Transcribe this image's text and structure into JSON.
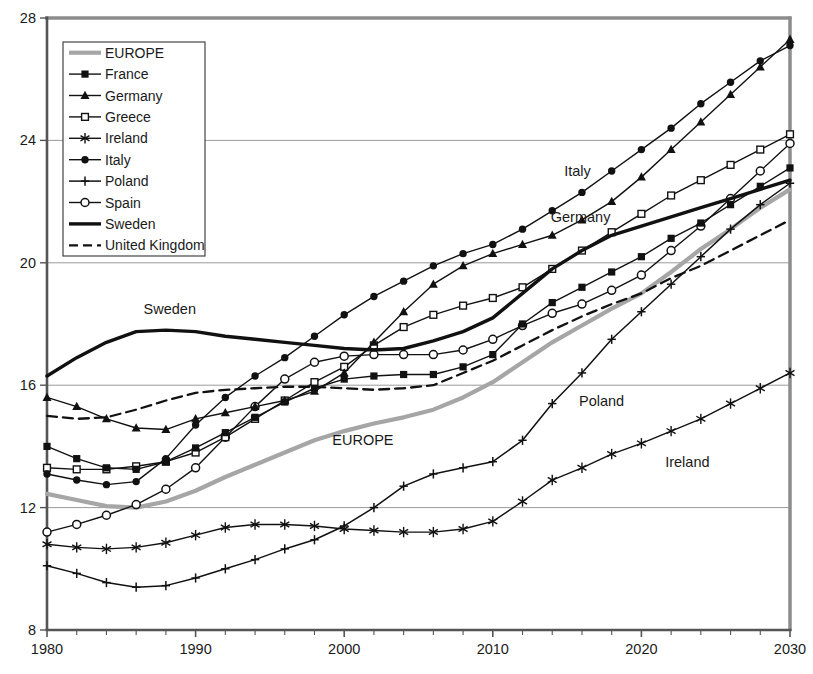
{
  "chart_data": {
    "type": "line",
    "title": "",
    "xlabel": "",
    "ylabel": "",
    "xlim": [
      1980,
      2030
    ],
    "ylim": [
      8,
      28
    ],
    "x_ticks": [
      1980,
      1990,
      2000,
      2010,
      2020,
      2030
    ],
    "x_minor_tick_step": 2,
    "y_ticks": [
      8,
      12,
      16,
      20,
      24,
      28
    ],
    "grid": "horizontal",
    "legend_position": "top-left-inside",
    "x": [
      1980,
      1982,
      1984,
      1986,
      1988,
      1990,
      1992,
      1994,
      1996,
      1998,
      2000,
      2002,
      2004,
      2006,
      2008,
      2010,
      2012,
      2014,
      2016,
      2018,
      2020,
      2022,
      2024,
      2026,
      2028,
      2030
    ],
    "series": [
      {
        "name": "EUROPE",
        "marker": "none",
        "color": "#a6a6a6",
        "width": 4.2,
        "dash": "",
        "values": [
          12.45,
          12.25,
          12.05,
          12.0,
          12.2,
          12.55,
          13.0,
          13.4,
          13.8,
          14.2,
          14.5,
          14.75,
          14.95,
          15.2,
          15.6,
          16.1,
          16.75,
          17.4,
          17.95,
          18.5,
          19.0,
          19.7,
          20.45,
          21.1,
          21.8,
          22.4
        ]
      },
      {
        "name": "France",
        "marker": "filled-square",
        "color": "#111111",
        "width": 1.4,
        "dash": "",
        "values": [
          14.0,
          13.6,
          13.3,
          13.25,
          13.5,
          13.95,
          14.45,
          14.95,
          15.45,
          15.9,
          16.2,
          16.3,
          16.35,
          16.35,
          16.6,
          17.0,
          18.0,
          18.7,
          19.2,
          19.7,
          20.2,
          20.8,
          21.3,
          21.9,
          22.5,
          23.1
        ]
      },
      {
        "name": "Germany",
        "marker": "filled-triangle",
        "color": "#111111",
        "width": 1.4,
        "dash": "",
        "values": [
          15.6,
          15.3,
          14.9,
          14.6,
          14.55,
          14.9,
          15.1,
          15.3,
          15.5,
          15.8,
          16.4,
          17.4,
          18.4,
          19.3,
          19.9,
          20.3,
          20.6,
          20.9,
          21.4,
          22.0,
          22.8,
          23.7,
          24.6,
          25.5,
          26.4,
          27.3
        ]
      },
      {
        "name": "Greece",
        "marker": "open-square",
        "color": "#111111",
        "width": 1.4,
        "dash": "",
        "values": [
          13.3,
          13.25,
          13.25,
          13.35,
          13.5,
          13.8,
          14.3,
          14.9,
          15.5,
          16.1,
          16.6,
          17.3,
          17.9,
          18.3,
          18.6,
          18.85,
          19.2,
          19.8,
          20.4,
          21.0,
          21.6,
          22.2,
          22.7,
          23.2,
          23.7,
          24.2
        ]
      },
      {
        "name": "Ireland",
        "marker": "asterisk",
        "color": "#111111",
        "width": 1.4,
        "dash": "",
        "values": [
          10.8,
          10.7,
          10.65,
          10.7,
          10.85,
          11.1,
          11.35,
          11.45,
          11.45,
          11.4,
          11.3,
          11.25,
          11.2,
          11.2,
          11.3,
          11.55,
          12.2,
          12.9,
          13.3,
          13.75,
          14.1,
          14.5,
          14.9,
          15.4,
          15.9,
          16.4
        ]
      },
      {
        "name": "Italy",
        "marker": "filled-circle",
        "color": "#111111",
        "width": 1.4,
        "dash": "",
        "values": [
          13.1,
          12.9,
          12.75,
          12.85,
          13.6,
          14.7,
          15.6,
          16.3,
          16.9,
          17.6,
          18.3,
          18.9,
          19.4,
          19.9,
          20.3,
          20.6,
          21.1,
          21.7,
          22.3,
          23.0,
          23.7,
          24.4,
          25.2,
          25.9,
          26.6,
          27.1
        ]
      },
      {
        "name": "Poland",
        "marker": "plus",
        "color": "#111111",
        "width": 1.5,
        "dash": "",
        "values": [
          10.1,
          9.85,
          9.55,
          9.4,
          9.45,
          9.7,
          10.0,
          10.3,
          10.65,
          10.95,
          11.4,
          12.0,
          12.7,
          13.1,
          13.3,
          13.5,
          14.2,
          15.4,
          16.4,
          17.5,
          18.4,
          19.3,
          20.2,
          21.1,
          21.9,
          22.6
        ]
      },
      {
        "name": "Spain",
        "marker": "open-circle",
        "color": "#111111",
        "width": 1.4,
        "dash": "",
        "values": [
          11.2,
          11.45,
          11.75,
          12.1,
          12.6,
          13.3,
          14.3,
          15.3,
          16.2,
          16.75,
          16.95,
          17.0,
          17.0,
          17.0,
          17.15,
          17.5,
          17.95,
          18.35,
          18.65,
          19.1,
          19.6,
          20.4,
          21.2,
          22.1,
          23.0,
          23.9
        ]
      },
      {
        "name": "Sweden",
        "marker": "none",
        "color": "#111111",
        "width": 3.4,
        "dash": "",
        "values": [
          16.3,
          16.9,
          17.4,
          17.75,
          17.8,
          17.75,
          17.6,
          17.5,
          17.4,
          17.3,
          17.2,
          17.15,
          17.2,
          17.45,
          17.75,
          18.2,
          19.0,
          19.8,
          20.4,
          20.9,
          21.2,
          21.5,
          21.8,
          22.1,
          22.4,
          22.7
        ]
      },
      {
        "name": "United Kingdom",
        "marker": "none",
        "color": "#111111",
        "width": 2.3,
        "dash": "10 6",
        "values": [
          15.0,
          14.9,
          14.95,
          15.2,
          15.5,
          15.75,
          15.85,
          15.9,
          15.95,
          15.95,
          15.9,
          15.85,
          15.9,
          16.0,
          16.4,
          16.8,
          17.3,
          17.8,
          18.25,
          18.65,
          19.0,
          19.5,
          19.9,
          20.4,
          20.9,
          21.4
        ]
      }
    ],
    "inline_labels": [
      {
        "text": "Sweden",
        "x": 1986.5,
        "y": 18.5
      },
      {
        "text": "Italy",
        "x": 2014.8,
        "y": 23.0
      },
      {
        "text": "Germany",
        "x": 2013.9,
        "y": 21.5
      },
      {
        "text": "EUROPE",
        "x": 1999.2,
        "y": 14.2
      },
      {
        "text": "Poland",
        "x": 2015.8,
        "y": 15.5
      },
      {
        "text": "Ireland",
        "x": 2021.6,
        "y": 13.5
      }
    ],
    "colors": {
      "axis": "#555555",
      "border": "#8c8c8c",
      "grid": "#9a9a9a",
      "text": "#1a1a1a",
      "background": "#ffffff",
      "europe_gray": "#a6a6a6",
      "series_black": "#111111"
    }
  }
}
